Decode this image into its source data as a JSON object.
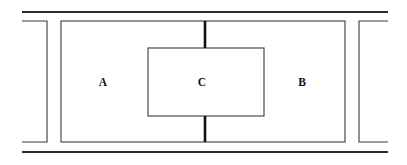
{
  "figure": {
    "kind": "line-diagram",
    "background_color": "#ffffff",
    "line_color": "#3a3a3a",
    "accent_color": "#111111",
    "width": 407,
    "height": 165
  },
  "rules": {
    "top": {
      "name": "top-horizontal-rule",
      "x1": 22,
      "y1": 12,
      "x2": 388,
      "y2": 12
    },
    "bottom": {
      "name": "bottom-horizontal-rule",
      "x1": 22,
      "y1": 152,
      "x2": 388,
      "y2": 152
    }
  },
  "brackets": {
    "left": {
      "name": "left-bracket",
      "orientation": "open-left",
      "path": "M 22 21 L 47 21 L 47 142 L 22 142"
    },
    "right": {
      "name": "right-bracket",
      "orientation": "open-right",
      "path": "M 388 21 L 359 21 L 359 142 L 388 142"
    }
  },
  "regions": {
    "outer": {
      "name": "outer-region",
      "x": 61,
      "y": 21,
      "width": 284,
      "height": 121
    },
    "inner": {
      "name": "inner-region",
      "x": 148,
      "y": 48,
      "width": 116,
      "height": 68
    }
  },
  "connectors": [
    {
      "name": "top-connector",
      "x1": 205,
      "y1": 21,
      "x2": 205,
      "y2": 48
    },
    {
      "name": "bottom-connector",
      "x1": 205,
      "y1": 116,
      "x2": 205,
      "y2": 142
    }
  ],
  "labels": [
    {
      "name": "label-a",
      "text": "A",
      "x": 103,
      "y": 82
    },
    {
      "name": "label-c",
      "text": "C",
      "x": 202,
      "y": 82
    },
    {
      "name": "label-b",
      "text": "B",
      "x": 302,
      "y": 82
    }
  ]
}
